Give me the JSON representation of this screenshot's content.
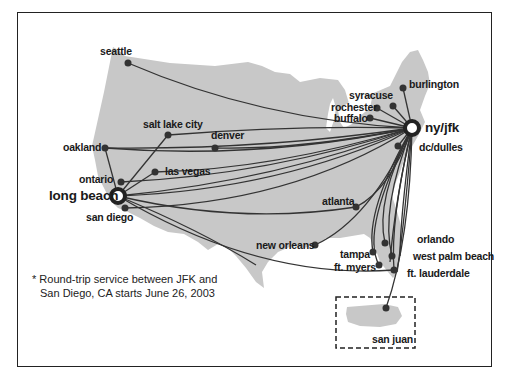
{
  "map": {
    "title": "Route map",
    "land_color": "#c8c8c8",
    "route_color": "#333333",
    "hubs": [
      {
        "name": "ny/jfk",
        "x": 412,
        "y": 128
      },
      {
        "name": "long beach",
        "x": 118,
        "y": 196
      }
    ],
    "cities": [
      {
        "name": "seattle",
        "x": 128,
        "y": 63
      },
      {
        "name": "salt lake city",
        "x": 168,
        "y": 135
      },
      {
        "name": "denver",
        "x": 215,
        "y": 148
      },
      {
        "name": "oakland",
        "x": 105,
        "y": 148
      },
      {
        "name": "las vegas",
        "x": 155,
        "y": 172
      },
      {
        "name": "ontario",
        "x": 121,
        "y": 182
      },
      {
        "name": "san diego",
        "x": 125,
        "y": 208
      },
      {
        "name": "syracuse",
        "x": 393,
        "y": 106
      },
      {
        "name": "rochester",
        "x": 377,
        "y": 108
      },
      {
        "name": "buffalo",
        "x": 370,
        "y": 118
      },
      {
        "name": "burlington",
        "x": 403,
        "y": 88
      },
      {
        "name": "dc/dulles",
        "x": 398,
        "y": 146
      },
      {
        "name": "atlanta",
        "x": 356,
        "y": 207
      },
      {
        "name": "new orleans",
        "x": 315,
        "y": 245
      },
      {
        "name": "orlando",
        "x": 385,
        "y": 243
      },
      {
        "name": "tampa",
        "x": 373,
        "y": 252
      },
      {
        "name": "west palm beach",
        "x": 392,
        "y": 256
      },
      {
        "name": "ft. myers",
        "x": 379,
        "y": 265
      },
      {
        "name": "ft. lauderdale",
        "x": 394,
        "y": 270
      },
      {
        "name": "san juan",
        "x": 386,
        "y": 308
      }
    ],
    "inset_label": "san juan",
    "footnote": {
      "line1": "* Round-trip service between JFK and",
      "line2": "San Diego, CA starts June 26, 2003"
    }
  }
}
